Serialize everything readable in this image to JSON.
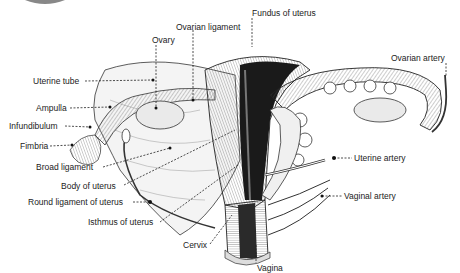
{
  "diagram": {
    "labels": {
      "ovarian_ligament": "Ovarian ligament",
      "fundus_of_uterus": "Fundus of uterus",
      "ovary": "Ovary",
      "ovarian_artery": "Ovarian artery",
      "uterine_tube": "Uterine tube",
      "ampulla": "Ampulla",
      "infundibulum": "Infundibulum",
      "fimbria": "Fimbria",
      "broad_ligament": "Broad ligament",
      "body_of_uterus": "Body of uterus",
      "round_ligament_of_uterus": "Round ligament of uterus",
      "isthmus_of_uterus": "Isthmus of uterus",
      "cervix": "Cervix",
      "uterine_artery": "Uterine artery",
      "vaginal_artery": "Vaginal artery",
      "vagina": "Vagina"
    },
    "colors": {
      "ink": "#222222",
      "background": "#ffffff",
      "shade_dark": "#1a1a1a",
      "shade_mid": "#777777"
    }
  }
}
